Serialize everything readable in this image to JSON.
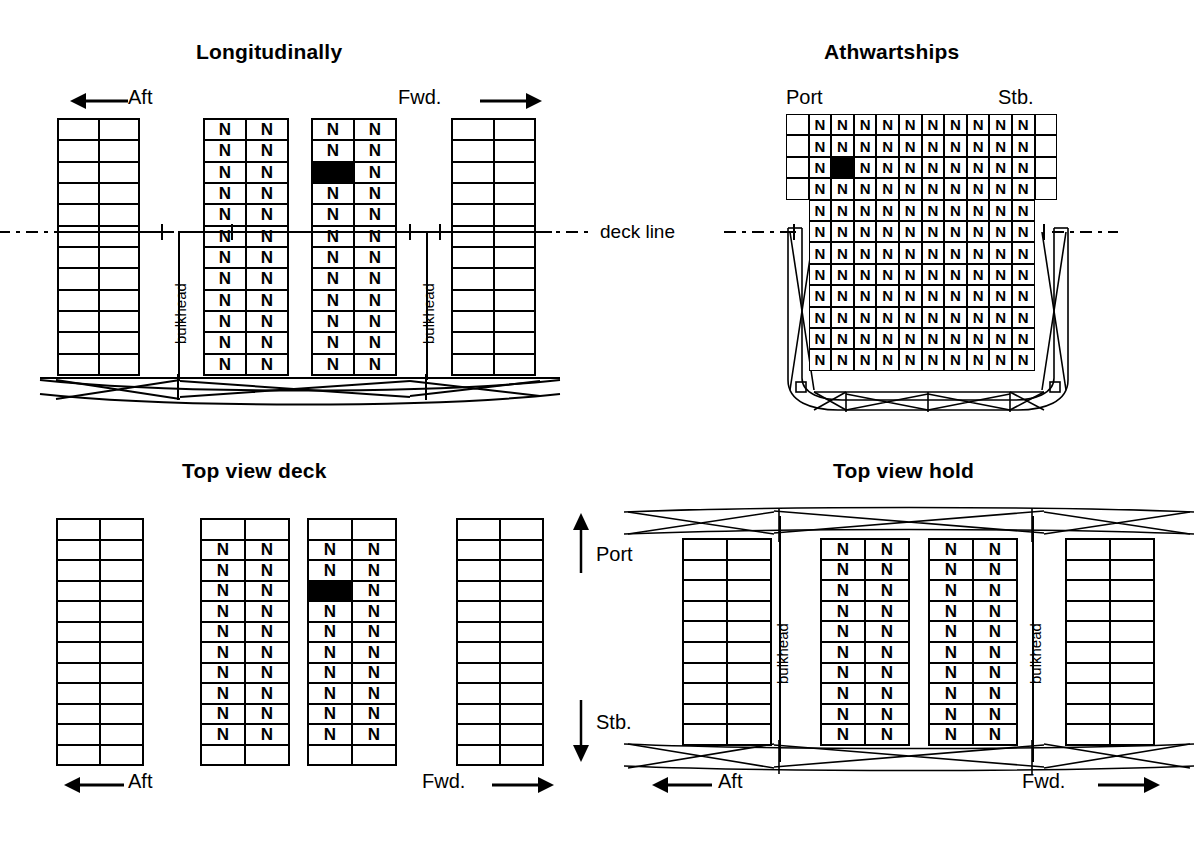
{
  "figure": {
    "cell_letter": "N",
    "deck_line_label": "deck line",
    "bulkhead_label": "bulkhead",
    "colors": {
      "ink": "#000000",
      "paper": "#ffffff",
      "highlight": "#000000"
    }
  },
  "panels": {
    "longitudinal": {
      "title": "Longitudinally",
      "aft_label": "Aft",
      "fwd_label": "Fwd.",
      "bulkhead_label": "bulkhead",
      "rows": 12,
      "cols": 2,
      "stacks": [
        {
          "name": "aft-empty-stack",
          "filled": false,
          "letter": ""
        },
        {
          "name": "aft-hold-stack",
          "filled": true,
          "letter": "N"
        },
        {
          "name": "fwd-hold-stack",
          "filled": true,
          "letter": "N",
          "highlight": {
            "row": 3,
            "col": 1
          }
        },
        {
          "name": "fwd-empty-stack",
          "filled": false,
          "letter": ""
        }
      ]
    },
    "athwartships": {
      "title": "Athwartships",
      "port_label": "Port",
      "stb_label": "Stb.",
      "rows": 12,
      "cols": 12,
      "deck_rows": 4,
      "deck_filled_cols": [
        2,
        3,
        4,
        5,
        6,
        7,
        8,
        9,
        10,
        11
      ],
      "hold_filled_cols": [
        2,
        3,
        4,
        5,
        6,
        7,
        8,
        9,
        10,
        11
      ],
      "highlight": {
        "row": 3,
        "col": 3
      }
    },
    "top_view_deck": {
      "title": "Top view deck",
      "aft_label": "Aft",
      "fwd_label": "Fwd.",
      "port_label": "Port",
      "stb_label": "Stb.",
      "rows": 12,
      "cols": 2,
      "filled_rows_start": 2,
      "filled_rows_end": 11,
      "stacks": [
        {
          "name": "aft-empty-stack",
          "filled": false,
          "letter": ""
        },
        {
          "name": "aft-deck-stack",
          "filled": true,
          "letter": "N"
        },
        {
          "name": "fwd-deck-stack",
          "filled": true,
          "letter": "N",
          "highlight": {
            "row": 4,
            "col": 1
          }
        },
        {
          "name": "fwd-empty-stack",
          "filled": false,
          "letter": ""
        }
      ]
    },
    "top_view_hold": {
      "title": "Top view hold",
      "aft_label": "Aft",
      "fwd_label": "Fwd.",
      "bulkhead_label": "bulkhead",
      "rows": 10,
      "cols": 2,
      "stacks": [
        {
          "name": "aft-empty-stack",
          "filled": false,
          "letter": ""
        },
        {
          "name": "aft-hold-stack",
          "filled": true,
          "letter": "N"
        },
        {
          "name": "fwd-hold-stack",
          "filled": true,
          "letter": "N"
        },
        {
          "name": "fwd-empty-stack",
          "filled": false,
          "letter": ""
        }
      ]
    }
  }
}
